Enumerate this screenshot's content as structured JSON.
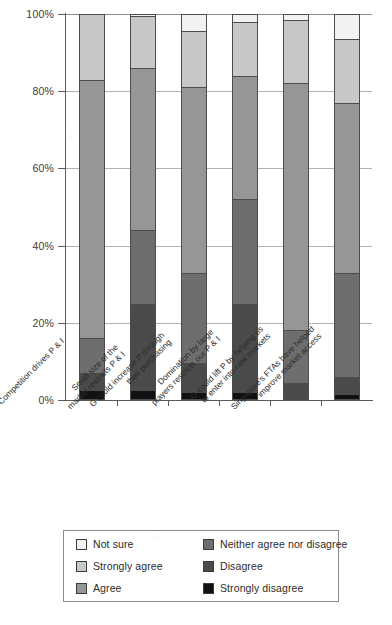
{
  "chart_data": {
    "type": "bar",
    "subtype": "stacked-bar-100-percent",
    "title": "",
    "xlabel": "",
    "ylabel": "",
    "ylim": [
      0,
      100
    ],
    "ytick_labels": [
      "0%",
      "20%",
      "40%",
      "60%",
      "80%",
      "100%"
    ],
    "ytick_values": [
      0,
      20,
      40,
      60,
      80,
      100
    ],
    "grid": true,
    "legend_position": "bottom",
    "stack_order_bottom_to_top": [
      "Strongly disagree",
      "Disagree",
      "Neither agree nor disagree",
      "Agree",
      "Strongly agree",
      "Not sure"
    ],
    "categories": [
      "Competition drives P & I",
      "Small size of the market restricts P & I",
      "G could increase P through their purchasing",
      "Domination by large players restricts our P & I",
      "G could lift P by helping us to enter into new markets",
      "Singapore's FTAs have helped improve market access"
    ],
    "category_lines": [
      [
        "Competition drives P & I",
        ""
      ],
      [
        "Small size of the",
        "market restricts P & I"
      ],
      [
        "G could increase P through",
        "their purchasing"
      ],
      [
        "Domination by large",
        "players restricts our P & I"
      ],
      [
        "G could lift P by helping us",
        "to enter into new markets"
      ],
      [
        "Singapore's FTAs have helped",
        "improve market access"
      ]
    ],
    "series": [
      {
        "name": "Strongly disagree",
        "color": "#111111",
        "values": [
          2.5,
          2.5,
          2.0,
          2.0,
          0.5,
          1.5
        ]
      },
      {
        "name": "Disagree",
        "color": "#4a4a4a",
        "values": [
          4.5,
          22.5,
          7.5,
          23.0,
          4.0,
          4.5
        ]
      },
      {
        "name": "Neither agree nor disagree",
        "color": "#6e6e6e",
        "values": [
          9.0,
          19.0,
          23.5,
          27.0,
          13.5,
          27.0
        ]
      },
      {
        "name": "Agree",
        "color": "#969696",
        "values": [
          67.0,
          42.0,
          48.0,
          32.0,
          64.0,
          44.0
        ]
      },
      {
        "name": "Strongly agree",
        "color": "#c8c8c8",
        "values": [
          17.0,
          13.5,
          14.5,
          14.0,
          16.5,
          16.5
        ]
      },
      {
        "name": "Not sure",
        "color": "#f2f2f2",
        "values": [
          0.0,
          0.5,
          4.5,
          2.0,
          1.5,
          6.5
        ]
      }
    ]
  },
  "legend": {
    "items": [
      {
        "label": "Not sure",
        "color": "#f2f2f2"
      },
      {
        "label": "Neither agree nor disagree",
        "color": "#6e6e6e"
      },
      {
        "label": "Strongly agree",
        "color": "#c8c8c8"
      },
      {
        "label": "Disagree",
        "color": "#4a4a4a"
      },
      {
        "label": "Agree",
        "color": "#969696"
      },
      {
        "label": "Strongly disagree",
        "color": "#111111"
      }
    ]
  }
}
